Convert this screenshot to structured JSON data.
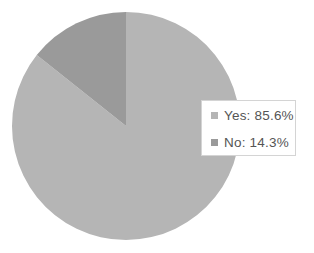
{
  "chart_data": {
    "type": "pie",
    "title": "",
    "categories": [
      "Yes",
      "No"
    ],
    "values": [
      85.6,
      14.3
    ],
    "colors": [
      "#b5b5b5",
      "#9a9a9a"
    ],
    "start_angle_deg": 0,
    "direction": "clockwise",
    "legend_position": "right",
    "data_labels": false
  },
  "legend": {
    "items": [
      {
        "label": "Yes: 85.6%",
        "color": "#b5b5b5"
      },
      {
        "label": "No: 14.3%",
        "color": "#9a9a9a"
      }
    ]
  }
}
